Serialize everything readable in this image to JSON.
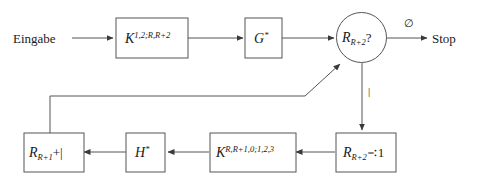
{
  "diagram": {
    "type": "flowchart",
    "title": "",
    "language": "de",
    "colors": {
      "background": "#ffffff",
      "stroke": "#555555",
      "text": "#1a1a1a"
    },
    "nodes": [
      {
        "id": "input",
        "shape": "text",
        "label": "Eingabe"
      },
      {
        "id": "k-first",
        "shape": "rect",
        "base": "K",
        "superscript": "1,2;R,R+2",
        "subscript": "",
        "label": "K^{1,2;R,R+2}"
      },
      {
        "id": "g-star",
        "shape": "rect",
        "base": "G",
        "superscript": "*",
        "subscript": "",
        "label": "G^{*}"
      },
      {
        "id": "decision",
        "shape": "circle",
        "base": "R",
        "superscript": "",
        "subscript": "R+2",
        "suffix": "?",
        "label": "R_{R+2}?"
      },
      {
        "id": "stop",
        "shape": "text",
        "label": "Stop"
      },
      {
        "id": "r-monus",
        "shape": "rect",
        "base": "R",
        "superscript": "",
        "subscript": "R+2",
        "suffix": "∹1",
        "label": "R_{R+2} ∸ 1"
      },
      {
        "id": "k-second",
        "shape": "rect",
        "base": "K",
        "superscript": "R,R+1,0;1,2,3",
        "subscript": "",
        "label": "K^{R,R+1,0;1,2,3}"
      },
      {
        "id": "h-star",
        "shape": "rect",
        "base": "H",
        "superscript": "*",
        "subscript": "",
        "label": "H^{*}"
      },
      {
        "id": "r-plus-bar",
        "shape": "rect",
        "base": "R",
        "superscript": "",
        "subscript": "R+1",
        "suffix": "+|",
        "label": "R_{R+1} + |"
      }
    ],
    "edge_labels": {
      "empty_set": "∅",
      "bar": "|"
    }
  }
}
